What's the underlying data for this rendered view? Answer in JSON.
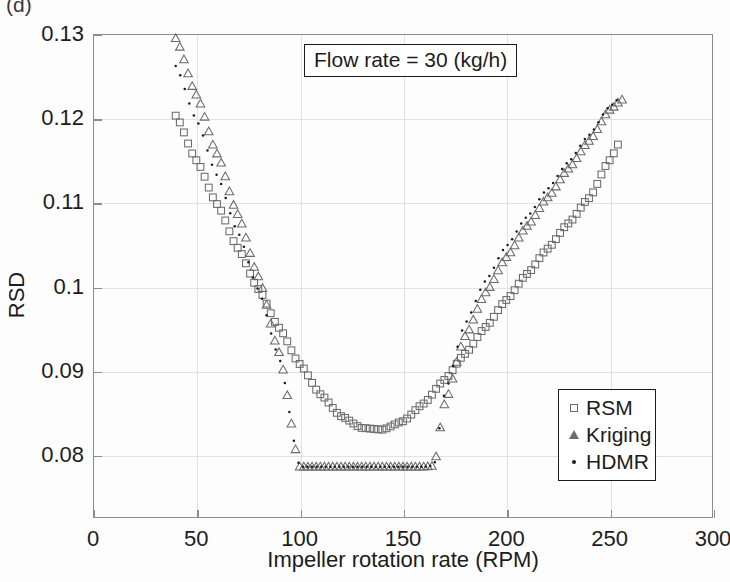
{
  "panel": {
    "label": "(d)"
  },
  "annotation": {
    "text": "Flow rate = 30 (kg/h)"
  },
  "axes": {
    "xlabel": "Impeller rotation rate (RPM)",
    "ylabel": "RSD",
    "xticks": [
      "0",
      "50",
      "100",
      "150",
      "200",
      "250",
      "300"
    ],
    "yticks": [
      "0.13",
      "0.12",
      "0.11",
      "0.1",
      "0.09",
      "0.08"
    ]
  },
  "legend": {
    "items": [
      {
        "label": "RSM",
        "marker": "square-marker-icon"
      },
      {
        "label": "Kriging",
        "marker": "triangle-marker-icon"
      },
      {
        "label": "HDMR",
        "marker": "dot-marker-icon"
      }
    ]
  },
  "colors": {
    "marker_gray": "#6b6b6b",
    "dot_black": "#1c1c1c",
    "axis_gray": "#8d8d8d",
    "grid_gray": "#e2e2e2"
  },
  "chart_data": {
    "type": "line",
    "title": "Flow rate = 30 (kg/h)",
    "xlabel": "Impeller rotation rate (RPM)",
    "ylabel": "RSD",
    "xlim": [
      0,
      300
    ],
    "ylim": [
      0.0725,
      0.13
    ],
    "xticks": [
      0,
      50,
      100,
      150,
      200,
      250,
      300
    ],
    "yticks": [
      0.08,
      0.09,
      0.1,
      0.11,
      0.12,
      0.13
    ],
    "grid": true,
    "legend_position": "lower-right",
    "series": [
      {
        "name": "RSM",
        "marker": "square",
        "x": [
          40,
          50,
          60,
          70,
          80,
          90,
          100,
          110,
          120,
          130,
          140,
          150,
          160,
          170,
          180,
          190,
          200,
          210,
          220,
          230,
          240,
          250,
          255
        ],
        "y": [
          0.1203,
          0.115,
          0.1098,
          0.1046,
          0.0997,
          0.0951,
          0.0908,
          0.0872,
          0.0846,
          0.0832,
          0.083,
          0.084,
          0.0861,
          0.0889,
          0.092,
          0.0952,
          0.0984,
          0.1015,
          0.1045,
          0.1075,
          0.1105,
          0.115,
          0.1172
        ]
      },
      {
        "name": "Kriging",
        "marker": "triangle",
        "x": [
          40,
          50,
          60,
          70,
          80,
          90,
          100,
          110,
          120,
          130,
          140,
          150,
          160,
          165,
          170,
          180,
          190,
          200,
          210,
          220,
          230,
          240,
          250,
          256
        ],
        "y": [
          0.1295,
          0.1228,
          0.1158,
          0.1086,
          0.1012,
          0.0922,
          0.0786,
          0.0786,
          0.0786,
          0.0786,
          0.0786,
          0.0786,
          0.0786,
          0.0787,
          0.086,
          0.0941,
          0.0993,
          0.1035,
          0.1072,
          0.1106,
          0.114,
          0.1173,
          0.121,
          0.1222
        ]
      },
      {
        "name": "HDMR",
        "marker": "dot",
        "x": [
          40,
          50,
          60,
          70,
          80,
          90,
          100,
          110,
          120,
          130,
          140,
          150,
          160,
          165,
          170,
          180,
          190,
          200,
          210,
          220,
          230,
          240,
          250,
          254
        ],
        "y": [
          0.1262,
          0.1198,
          0.1132,
          0.1065,
          0.0996,
          0.0916,
          0.0786,
          0.0786,
          0.0786,
          0.0786,
          0.0786,
          0.0786,
          0.0786,
          0.0787,
          0.0872,
          0.0956,
          0.1007,
          0.1048,
          0.1083,
          0.1116,
          0.1148,
          0.118,
          0.1214,
          0.1222
        ]
      }
    ]
  }
}
